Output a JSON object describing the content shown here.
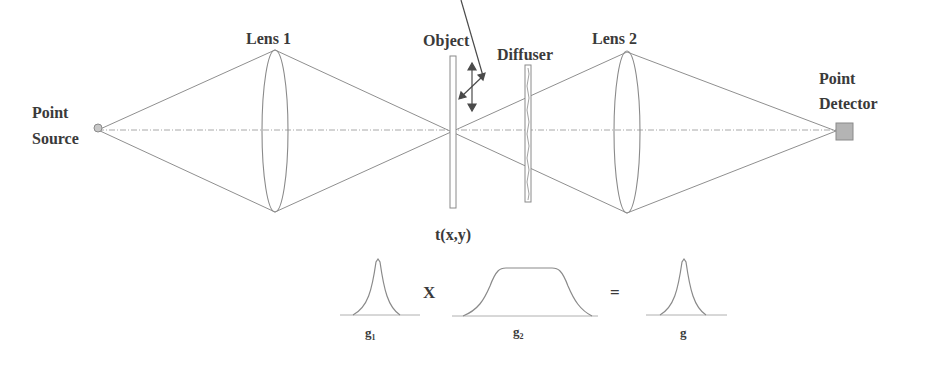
{
  "diagram": {
    "labels": {
      "point_source": [
        "Point",
        "Source"
      ],
      "lens1": "Lens 1",
      "object": "Object",
      "diffuser": "Diffuser",
      "lens2": "Lens 2",
      "point_detector": [
        "Point",
        "Detector"
      ],
      "transmission": "t(x,y)"
    },
    "equation": {
      "operator_multiply": "X",
      "operator_equals": "=",
      "g1_label": "g",
      "g1_sub": "1",
      "g2_label": "g",
      "g2_sub": "2",
      "g_label": "g"
    },
    "colors": {
      "text": "#3a3a3a",
      "rays": "#8f8f8f",
      "source_fill": "#c8c8c8",
      "detector_fill": "#b4b4b4"
    }
  }
}
